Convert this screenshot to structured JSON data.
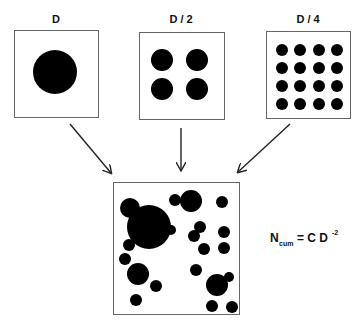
{
  "panels": [
    {
      "label": "D",
      "grid": 1,
      "circles": [
        {
          "cx": 56,
          "cy": 73,
          "r": 22
        }
      ]
    },
    {
      "label": "D / 2",
      "grid": 2,
      "circles": [
        {
          "cx": 163,
          "cy": 60,
          "r": 11
        },
        {
          "cx": 197,
          "cy": 60,
          "r": 11
        },
        {
          "cx": 163,
          "cy": 89,
          "r": 11
        },
        {
          "cx": 197,
          "cy": 89,
          "r": 11
        }
      ]
    },
    {
      "label": "D / 4",
      "grid": 4
    }
  ],
  "combined": {
    "label": "combined-distribution"
  },
  "formula": {
    "lhs": "N",
    "lhs_sub": "cum",
    "rhs": "= C D",
    "exponent": "-2"
  },
  "colors": {
    "ink": "#000000",
    "frame": "#666666",
    "arrow": "#222222"
  }
}
